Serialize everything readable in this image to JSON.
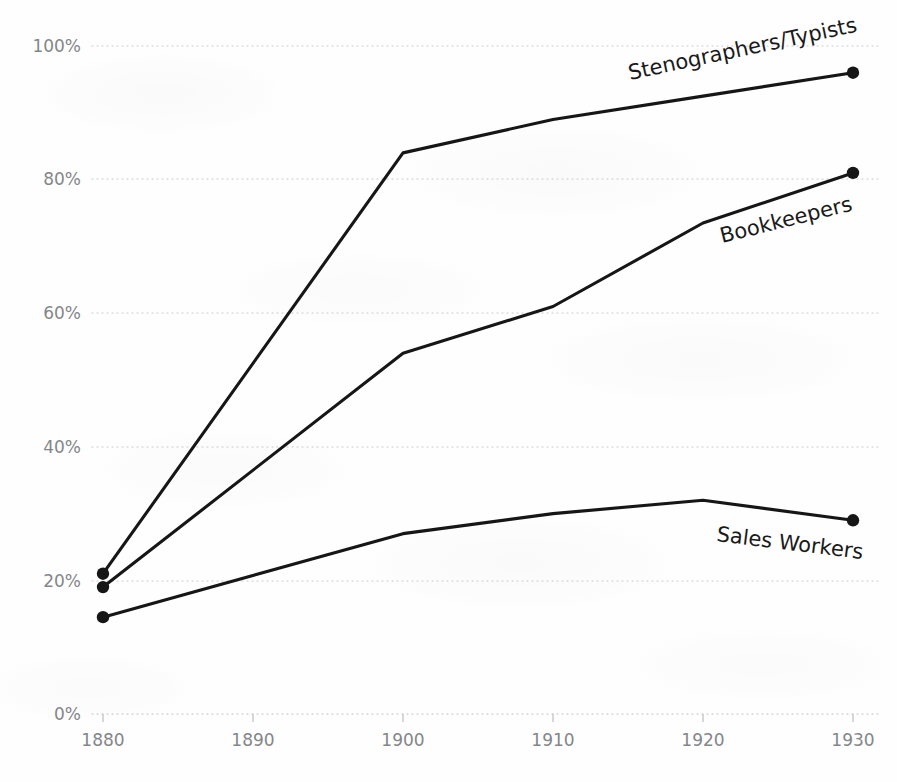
{
  "chart_data": {
    "type": "line",
    "title": "",
    "subtitle": "",
    "xlabel": "",
    "ylabel": "",
    "x": [
      1880,
      1890,
      1900,
      1910,
      1920,
      1930
    ],
    "xtick_labels": [
      "1880",
      "1890",
      "1900",
      "1910",
      "1920",
      "1930"
    ],
    "ytick_labels": [
      "0%",
      "20%",
      "40%",
      "60%",
      "80%",
      "100%"
    ],
    "ytick_values": [
      0,
      20,
      40,
      60,
      80,
      100
    ],
    "xlim": [
      1880,
      1930
    ],
    "ylim": [
      0,
      100
    ],
    "grid": "horizontal-dotted",
    "legend_position": "inline-end-of-line",
    "value_suffix": "%",
    "series": [
      {
        "name": "Stenographers/Typists",
        "label": "Stenographers/Typists",
        "label_rotation": -12,
        "x": [
          1880,
          1900,
          1910,
          1920,
          1930
        ],
        "values": [
          21,
          84,
          89,
          92.5,
          96
        ],
        "color": "#161616"
      },
      {
        "name": "Bookkeepers",
        "label": "Bookkeepers",
        "label_rotation": -14,
        "x": [
          1880,
          1900,
          1910,
          1920,
          1930
        ],
        "values": [
          19,
          54,
          61,
          73.5,
          81
        ],
        "color": "#161616"
      },
      {
        "name": "Sales Workers",
        "label": "Sales Workers",
        "label_rotation": 7,
        "x": [
          1880,
          1900,
          1910,
          1920,
          1930
        ],
        "values": [
          14.5,
          27,
          30,
          32,
          29
        ],
        "color": "#161616"
      }
    ]
  },
  "axes": {
    "y_labels": [
      "100%",
      "80%",
      "60%",
      "40%",
      "20%",
      "0%"
    ],
    "x_labels": [
      "1880",
      "1890",
      "1900",
      "1910",
      "1920",
      "1930"
    ]
  },
  "labels": {
    "stenographers": "Stenographers/Typists",
    "bookkeepers": "Bookkeepers",
    "sales_workers": "Sales Workers"
  },
  "colors": {
    "line": "#161616",
    "grid": "#c9c9cc",
    "tick_text": "#84868a",
    "label_text": "#1a1a1a",
    "background": "#fefefe"
  }
}
